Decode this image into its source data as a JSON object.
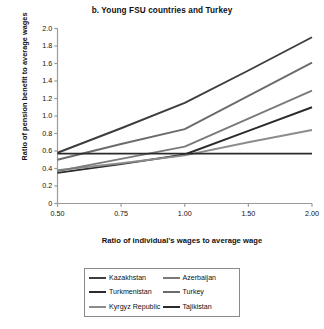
{
  "chart_data": {
    "type": "line",
    "title": "b. Young FSU countries and Turkey",
    "xlabel": "Ratio of individual's wages to average wage",
    "ylabel": "Ratio of pension benefit to average wages",
    "categories": [
      "0.50",
      "0.75",
      "1.00",
      "1.50",
      "2.00"
    ],
    "x": [
      0.5,
      0.75,
      1.0,
      1.5,
      2.0
    ],
    "xtick_labels": [
      "0.50",
      "0.75",
      "1.00",
      "1.50",
      "2.00"
    ],
    "ytick_labels": [
      "0",
      "0.2",
      "0.4",
      "0.6",
      "0.8",
      "1.0",
      "1.2",
      "1.4",
      "1.6",
      "1.8",
      "2.0"
    ],
    "ylim": [
      0,
      2.0
    ],
    "ytick_step": 0.2,
    "grid": false,
    "legend_position": "bottom",
    "series": [
      {
        "name": "Kazakhstan",
        "values": [
          0.58,
          0.86,
          1.15,
          1.52,
          1.9
        ],
        "color": "#3d3d3d"
      },
      {
        "name": "Turkmenistan",
        "values": [
          0.35,
          0.45,
          0.56,
          0.83,
          1.1
        ],
        "color": "#2b2b2b"
      },
      {
        "name": "Kyrgyz Republic",
        "values": [
          0.38,
          0.46,
          0.55,
          0.7,
          0.84
        ],
        "color": "#8c8c8c"
      },
      {
        "name": "Azerbaijan",
        "values": [
          0.37,
          0.51,
          0.65,
          0.97,
          1.29
        ],
        "color": "#7a7a7a"
      },
      {
        "name": "Turkey",
        "values": [
          0.5,
          0.68,
          0.85,
          1.23,
          1.61
        ],
        "color": "#6b6b6b"
      },
      {
        "name": "Tajikistan",
        "values": [
          0.57,
          0.57,
          0.57,
          0.57,
          0.57
        ],
        "color": "#2b2b2b"
      }
    ]
  },
  "legend": {
    "entries": [
      {
        "label": "Kazakhstan",
        "color": "#3d3d3d"
      },
      {
        "label": "Azerbaijan",
        "color": "#7a7a7a"
      },
      {
        "label": "Turkmenistan",
        "color": "#2b2b2b"
      },
      {
        "label": "Turkey",
        "color": "#6b6b6b"
      },
      {
        "label": "Kyrgyz Republic",
        "color": "#8c8c8c"
      },
      {
        "label": "Tajikistan",
        "color": "#2b2b2b"
      }
    ]
  },
  "axes": {
    "axis_color": "#9a9a9a"
  }
}
